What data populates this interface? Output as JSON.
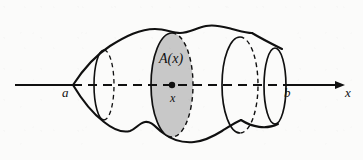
{
  "figure": {
    "background_color": "#fbfbfa",
    "ink_color": "#101010",
    "shaded_fill_color": "#c8c8c8"
  },
  "axis": {
    "name": "x-axis",
    "label": "x",
    "start_x": 15,
    "end_x": 345,
    "y": 85,
    "arrow": "right",
    "solid_segments": [
      [
        15,
        73
      ],
      [
        283,
        345
      ]
    ],
    "dashed_segment": [
      73,
      283
    ]
  },
  "labels": {
    "left_bound": "a",
    "right_bound": "b",
    "axis_name": "x",
    "cross_section_area": "A(x)",
    "sample_point": "x"
  },
  "points": {
    "a": {
      "label": "a",
      "x": 73,
      "y": 85
    },
    "x": {
      "label": "x",
      "x": 172,
      "y": 85,
      "marker": "filled-dot"
    },
    "b": {
      "label": "b",
      "x": 283,
      "y": 85
    }
  },
  "cross_sections": [
    {
      "name": "left-cross-section",
      "center_x": 104,
      "center_y": 85,
      "rx": 10,
      "ry": 35,
      "shaded": false
    },
    {
      "name": "shaded-cross-section",
      "center_x": 172,
      "center_y": 85,
      "rx": 21,
      "ry": 52,
      "shaded": true,
      "area_label": "A(x)"
    },
    {
      "name": "right-cross-section",
      "center_x": 240,
      "center_y": 85,
      "rx": 18,
      "ry": 48,
      "shaded": false
    },
    {
      "name": "end-cap-cross-section",
      "center_x": 275,
      "center_y": 85,
      "rx": 11,
      "ry": 38,
      "shaded": false
    }
  ],
  "line_styles": {
    "visible_edge": "solid",
    "hidden_edge": "dashed",
    "axis_inside_solid": "dashed"
  }
}
